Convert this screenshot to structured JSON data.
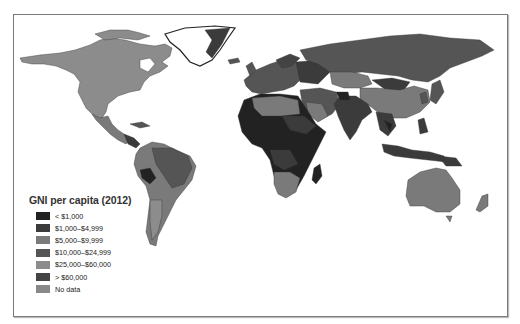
{
  "map": {
    "title": "GNI per capita (2012)",
    "legend": [
      {
        "label": "< $1,000",
        "color": "#222222"
      },
      {
        "label": "$1,000–$4,999",
        "color": "#3b3b3b"
      },
      {
        "label": "$5,000–$9,999",
        "color": "#7a7a7a"
      },
      {
        "label": "$10,000–$24,999",
        "color": "#555555"
      },
      {
        "label": "$25,000–$60,000",
        "color": "#8c8c8c"
      },
      {
        "label": "> $60,000",
        "color": "#444444"
      },
      {
        "label": "No data",
        "color": "#888888"
      }
    ]
  }
}
